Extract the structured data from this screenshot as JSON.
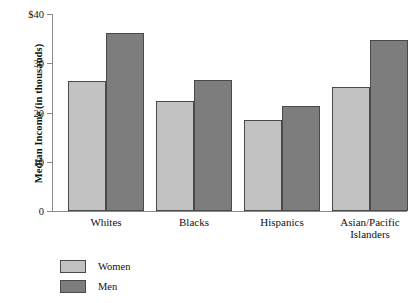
{
  "chart_data": {
    "type": "bar",
    "title": "",
    "xlabel": "",
    "ylabel": "Median Income (in thousands)",
    "categories": [
      "Whites",
      "Blacks",
      "Hispanics",
      "Asian/Pacific Islanders"
    ],
    "category_lines": [
      [
        "Whites"
      ],
      [
        "Blacks"
      ],
      [
        "Hispanics"
      ],
      [
        "Asian/Pacific",
        "Islanders"
      ]
    ],
    "series": [
      {
        "name": "Women",
        "color": "#c2c2c2",
        "values": [
          26.5,
          22.3,
          18.5,
          25.2
        ]
      },
      {
        "name": "Men",
        "color": "#7d7d7d",
        "values": [
          36.2,
          26.7,
          21.4,
          34.7
        ]
      }
    ],
    "ylim": [
      0,
      40
    ],
    "yticks": [
      0,
      10,
      20,
      30,
      40
    ],
    "ytick_labels": [
      "0",
      "10",
      "20",
      "30",
      "$40"
    ],
    "grid": false,
    "legend_position": "below-left"
  },
  "legend": {
    "items": [
      {
        "label": "Women",
        "color": "#c2c2c2"
      },
      {
        "label": "Men",
        "color": "#7d7d7d"
      }
    ]
  },
  "colors": {
    "women": "#c2c2c2",
    "men": "#7d7d7d",
    "axis": "#8a8a8a",
    "bar_outline": "#4a4a4a",
    "background": "#ffffff"
  }
}
